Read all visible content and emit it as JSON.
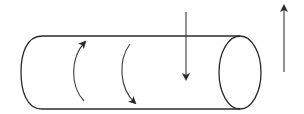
{
  "diagram": {
    "title": "",
    "elements": [
      {
        "id": "cylinder-body",
        "kind": "cylinder",
        "orientation": "horizontal"
      },
      {
        "id": "rotation-arrow-up",
        "kind": "curved-arrow",
        "direction": "counterclockwise-up"
      },
      {
        "id": "rotation-arrow-down",
        "kind": "curved-arrow",
        "direction": "clockwise-down"
      },
      {
        "id": "downward-arrow",
        "kind": "straight-arrow",
        "direction": "down"
      },
      {
        "id": "upward-arrow",
        "kind": "straight-arrow",
        "direction": "up"
      }
    ],
    "colors": {
      "line": "#2a2a2a",
      "background": "#ffffff"
    }
  }
}
